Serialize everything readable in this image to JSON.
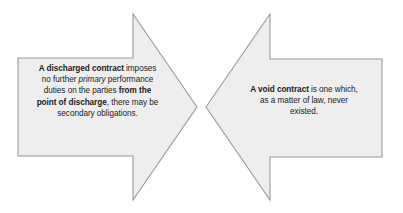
{
  "canvas": {
    "width": 403,
    "height": 213,
    "background_color": "#ffffff"
  },
  "style": {
    "shape_fill": "#eeeeef",
    "shape_stroke": "#9a9a9a",
    "text_color": "#1b1b1b"
  },
  "diagram": {
    "type": "two-opposing-block-arrows",
    "shapes": [
      {
        "id": "left-arrow",
        "name": "discharged-contract-arrow",
        "direction": "right",
        "fill": "#eeeeef",
        "stroke": "#9a9a9a",
        "points": "18,58 133,58 133,14 197,107 133,200 133,156 18,156",
        "text": {
          "line1_bold": "A discharged contract",
          "line1_rest": " imposes",
          "line2_pre": "no further ",
          "line2_italic": "primary",
          "line2_post": " performance",
          "line3_pre": "duties on the parties ",
          "line3_bold": "from the",
          "line4_bold": "point of discharge",
          "line4_post": ", there may be",
          "line5": "secondary obligations."
        }
      },
      {
        "id": "right-arrow",
        "name": "void-contract-arrow",
        "direction": "left",
        "fill": "#eeeeef",
        "stroke": "#9a9a9a",
        "points": "206,107 270,14 270,59 382,59 382,157 270,157 270,200",
        "text": {
          "line1_bold": "A void contract",
          "line1_rest": " is one which,",
          "line2": "as a matter of law, never",
          "line3": "existed."
        }
      }
    ]
  }
}
